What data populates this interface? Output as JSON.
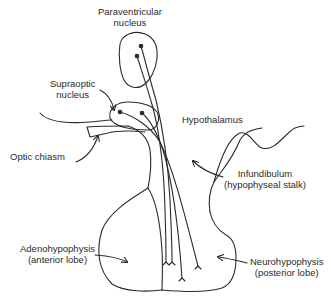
{
  "diagram": {
    "labels": {
      "paraventricular": {
        "line1": "Paraventricular",
        "line2": "nucleus"
      },
      "supraoptic": {
        "line1": "Supraoptic",
        "line2": "nucleus"
      },
      "optic_chiasm": {
        "line1": "Optic chiasm"
      },
      "hypothalamus": {
        "line1": "Hypothalamus"
      },
      "infundibulum": {
        "line1": "Infundibulum",
        "line2": "(hypophyseal stalk)"
      },
      "adenohypophysis": {
        "line1": "Adenohypophysis",
        "line2": "(anterior lobe)"
      },
      "neurohypophysis": {
        "line1": "Neurohypophysis",
        "line2": "(posterior lobe)"
      }
    },
    "colors": {
      "stroke": "#2a2a2a",
      "background": "#ffffff"
    }
  }
}
